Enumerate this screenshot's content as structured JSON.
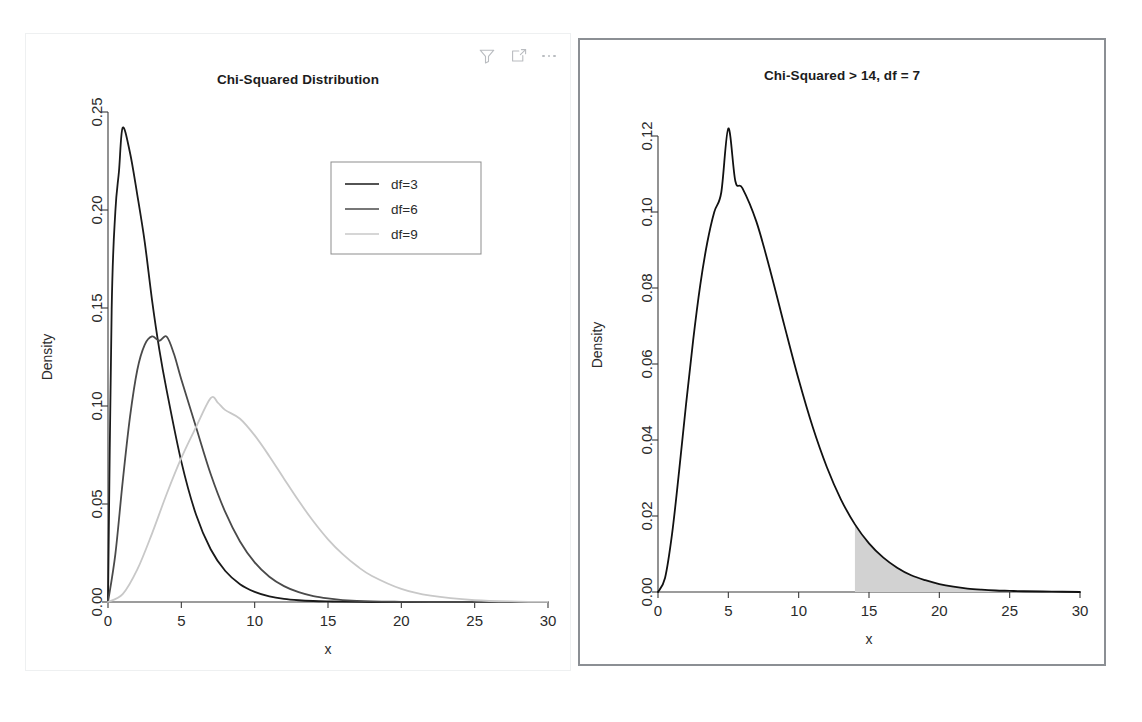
{
  "toolbar": {
    "items": [
      {
        "name": "filter-icon",
        "label": "Filter"
      },
      {
        "name": "expand-icon",
        "label": "Expand"
      },
      {
        "name": "more-icon",
        "label": "More options"
      }
    ]
  },
  "colors": {
    "curve_df3": "#1a1a1a",
    "curve_df6": "#4a4a4a",
    "curve_df9": "#c8c8c8",
    "curve_right": "#111111",
    "shade_fill": "#d2d2d2",
    "axis": "#3a3a3a",
    "panel_border_left": "#eef0f1",
    "panel_border_right": "#8b8f94",
    "background": "#ffffff"
  },
  "chart_data": [
    {
      "id": "left",
      "type": "line",
      "title": "Chi-Squared Distribution",
      "xlabel": "x",
      "ylabel": "Density",
      "xlim": [
        0,
        30
      ],
      "ylim": [
        0,
        0.25
      ],
      "xticks": [
        0,
        5,
        10,
        15,
        20,
        25,
        30
      ],
      "xticklabels": [
        "0",
        "5",
        "10",
        "15",
        "20",
        "25",
        "30"
      ],
      "yticks": [
        0.0,
        0.05,
        0.1,
        0.15,
        0.2,
        0.25
      ],
      "yticklabels": [
        "0.00",
        "0.05",
        "0.10",
        "0.15",
        "0.20",
        "0.25"
      ],
      "grid": false,
      "legend_position": "upper right",
      "legend_entries": [
        "df=3",
        "df=6",
        "df=9"
      ],
      "series": [
        {
          "name": "df=3",
          "color": "#1a1a1a",
          "peak_x": 1.0,
          "peak_y": 0.242,
          "x": [
            0.0,
            0.25,
            0.5,
            0.75,
            1.0,
            1.5,
            2.0,
            2.5,
            3.0,
            3.5,
            4.0,
            5.0,
            6.0,
            7.0,
            8.0,
            9.0,
            10.0,
            11.0,
            12.0,
            13.0,
            14.0,
            15.0,
            16.0,
            18.0,
            20.0,
            22.0,
            25.0,
            30.0
          ],
          "y": [
            0.0,
            0.1494,
            0.1991,
            0.2199,
            0.242,
            0.2292,
            0.2076,
            0.1839,
            0.1542,
            0.1288,
            0.108,
            0.0716,
            0.0446,
            0.0269,
            0.0158,
            0.0091,
            0.0052,
            0.0029,
            0.0016,
            0.0009,
            0.0005,
            0.0003,
            0.0002,
            0.0,
            0.0,
            0.0,
            0.0,
            0.0
          ]
        },
        {
          "name": "df=6",
          "color": "#4a4a4a",
          "peak_x": 4.0,
          "peak_y": 0.1354,
          "x": [
            0.0,
            0.5,
            1.0,
            1.5,
            2.0,
            2.5,
            3.0,
            3.5,
            4.0,
            4.5,
            5.0,
            6.0,
            7.0,
            8.0,
            9.0,
            10.0,
            11.0,
            12.0,
            13.0,
            14.0,
            15.0,
            16.0,
            18.0,
            20.0,
            22.0,
            25.0,
            30.0
          ],
          "y": [
            0.0,
            0.0243,
            0.0613,
            0.0944,
            0.1185,
            0.1312,
            0.1355,
            0.1333,
            0.1354,
            0.1265,
            0.1135,
            0.0893,
            0.0653,
            0.0458,
            0.0309,
            0.0202,
            0.0129,
            0.0081,
            0.005,
            0.003,
            0.0018,
            0.001,
            0.0003,
            0.0001,
            0.0,
            0.0,
            0.0
          ]
        },
        {
          "name": "df=9",
          "color": "#c8c8c8",
          "peak_x": 7.0,
          "peak_y": 0.104,
          "x": [
            0.0,
            1.0,
            2.0,
            3.0,
            4.0,
            5.0,
            6.0,
            7.0,
            7.5,
            8.0,
            9.0,
            10.0,
            11.0,
            12.0,
            13.0,
            14.0,
            15.0,
            16.0,
            17.0,
            18.0,
            20.0,
            22.0,
            25.0,
            28.0,
            30.0
          ],
          "y": [
            0.0,
            0.004,
            0.0166,
            0.0349,
            0.0551,
            0.0735,
            0.0892,
            0.104,
            0.1016,
            0.0979,
            0.0935,
            0.085,
            0.0744,
            0.0629,
            0.0516,
            0.0412,
            0.032,
            0.0244,
            0.0182,
            0.0133,
            0.0067,
            0.0032,
            0.0009,
            0.0002,
            0.0001
          ]
        }
      ]
    },
    {
      "id": "right",
      "type": "area",
      "title": "Chi-Squared > 14, df = 7",
      "xlabel": "x",
      "ylabel": "Density",
      "xlim": [
        0,
        30
      ],
      "ylim": [
        0,
        0.13
      ],
      "xticks": [
        0,
        5,
        10,
        15,
        20,
        25,
        30
      ],
      "xticklabels": [
        "0",
        "5",
        "10",
        "15",
        "20",
        "25",
        "30"
      ],
      "yticks": [
        0.0,
        0.02,
        0.04,
        0.06,
        0.08,
        0.1,
        0.12
      ],
      "yticklabels": [
        "0.00",
        "0.02",
        "0.04",
        "0.06",
        "0.08",
        "0.10",
        "0.12"
      ],
      "grid": false,
      "legend_position": "none",
      "df": 7,
      "shade_from": 14,
      "shade_to": 30,
      "shade_color": "#d2d2d2",
      "series": [
        {
          "name": "df=7",
          "color": "#111111",
          "peak_x": 5.0,
          "peak_y": 0.122,
          "x": [
            0.0,
            0.5,
            1.0,
            1.5,
            2.0,
            2.5,
            3.0,
            3.5,
            4.0,
            4.5,
            5.0,
            5.5,
            6.0,
            7.0,
            8.0,
            9.0,
            10.0,
            11.0,
            12.0,
            13.0,
            14.0,
            15.0,
            16.0,
            17.0,
            18.0,
            19.0,
            20.0,
            21.0,
            22.0,
            23.0,
            24.0,
            25.0,
            26.0,
            28.0,
            30.0
          ],
          "y": [
            0.0,
            0.0037,
            0.0153,
            0.0318,
            0.0496,
            0.0663,
            0.0807,
            0.0919,
            0.1,
            0.1052,
            0.122,
            0.1081,
            0.1063,
            0.0974,
            0.0843,
            0.0699,
            0.0559,
            0.0434,
            0.0329,
            0.0244,
            0.0178,
            0.0128,
            0.0091,
            0.0064,
            0.0044,
            0.0031,
            0.0021,
            0.0014,
            0.0009,
            0.0006,
            0.0004,
            0.0003,
            0.0002,
            0.0001,
            0.0
          ]
        }
      ]
    }
  ]
}
